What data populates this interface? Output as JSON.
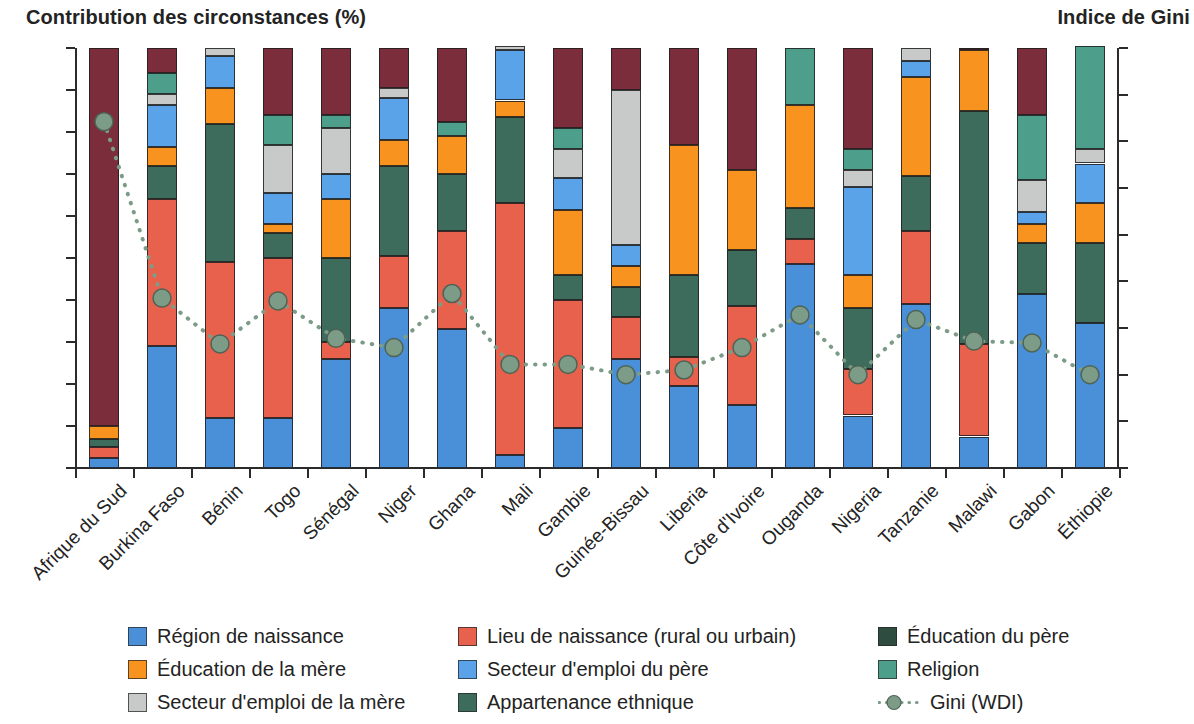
{
  "titles": {
    "left": "Contribution des circonstances (%)",
    "right": "Indice de Gini"
  },
  "axes": {
    "left": {
      "label": "Contribution des circonstances (%)",
      "min": 0,
      "max": 100,
      "step": 10,
      "ticks": [
        "0",
        "10",
        "20",
        "30",
        "40",
        "50",
        "60",
        "70",
        "80",
        "90",
        "100"
      ]
    },
    "right": {
      "label": "Indice de Gini",
      "min": 25,
      "max": 70,
      "step": 5,
      "ticks": [
        "25",
        "30",
        "35",
        "40",
        "45",
        "50",
        "55",
        "60",
        "65",
        "70"
      ]
    }
  },
  "legend": {
    "rows": [
      [
        {
          "key": "region_naissance",
          "label": "Région de naissance",
          "color": "#4A90D9"
        },
        {
          "key": "lieu_naissance",
          "label": "Lieu de naissance (rural ou urbain)",
          "color": "#E8614C"
        },
        {
          "key": "education_pere",
          "label": "Éducation du père",
          "color": "#2E4D40"
        }
      ],
      [
        {
          "key": "education_mere",
          "label": "Éducation de la mère",
          "color": "#F7931E"
        },
        {
          "key": "secteur_pere",
          "label": "Secteur d'emploi du père",
          "color": "#5AA3E8"
        },
        {
          "key": "religion",
          "label": "Religion",
          "color": "#4E9E8C"
        }
      ],
      [
        {
          "key": "secteur_mere",
          "label": "Secteur d'emploi de la mère",
          "color": "#C8C9C9"
        },
        {
          "key": "ethnie",
          "label": "Appartenance ethnique",
          "color": "#3D6B5C"
        },
        {
          "key": "gini",
          "label": "Gini (WDI)",
          "color": "#7C9C87"
        }
      ]
    ]
  },
  "chart_data": {
    "type": "bar",
    "subtype": "stacked-bar-with-line",
    "title": "Contribution des circonstances (%)",
    "xlabel": "",
    "ylabel": "Contribution des circonstances (%)",
    "y2label": "Indice de Gini",
    "ylim": [
      0,
      100
    ],
    "y2lim": [
      25,
      70
    ],
    "grid": false,
    "legend_position": "bottom",
    "categories": [
      "Afrique du Sud",
      "Burkina Faso",
      "Bénin",
      "Togo",
      "Sénégal",
      "Niger",
      "Ghana",
      "Mali",
      "Gambie",
      "Guinée-Bissau",
      "Liberia",
      "Côte d'Ivoire",
      "Ouganda",
      "Nigeria",
      "Tanzanie",
      "Malawi",
      "Gabon",
      "Éthiopie"
    ],
    "stack_order": [
      "region_naissance",
      "lieu_naissance",
      "ethnie",
      "education_mere",
      "education_pere",
      "secteur_pere",
      "secteur_mere",
      "religion",
      "autre"
    ],
    "series": [
      {
        "name": "Région de naissance",
        "key": "region_naissance",
        "color": "#4A90D9",
        "values": [
          2.5,
          29.0,
          12.0,
          12.0,
          26.0,
          38.0,
          33.0,
          3.0,
          9.5,
          26.0,
          19.5,
          15.0,
          48.5,
          12.5,
          39.0,
          7.5,
          41.5,
          34.5
        ]
      },
      {
        "name": "Lieu de naissance (rural ou urbain)",
        "key": "lieu_naissance",
        "color": "#E8614C",
        "values": [
          2.5,
          35.0,
          37.0,
          38.0,
          4.0,
          12.5,
          23.5,
          60.0,
          30.5,
          7.0,
          7.0,
          23.5,
          6.0,
          11.0,
          17.5,
          38.0,
          0.0,
          0.0
        ]
      },
      {
        "name": "Appartenance ethnique",
        "key": "ethnie",
        "color": "#3D6B5C",
        "values": [
          2.0,
          0.0,
          0.0,
          0.0,
          0.0,
          0.0,
          0.0,
          0.0,
          0.0,
          0.0,
          0.0,
          0.0,
          0.0,
          0.0,
          0.0,
          0.0,
          0.0,
          0.0
        ]
      },
      {
        "name": "Éducation de la mère",
        "key": "education_mere",
        "color": "#F7931E",
        "values": [
          3.0,
          0.0,
          0.0,
          0.0,
          0.0,
          0.0,
          0.0,
          0.0,
          0.0,
          0.0,
          0.0,
          0.0,
          0.0,
          0.0,
          0.0,
          0.0,
          0.0,
          0.0
        ]
      },
      {
        "name": "Autre (résiduel)",
        "key": "autre",
        "color": "#7B2D3C",
        "values": [
          90.0,
          0.0,
          0.0,
          0.0,
          0.0,
          0.0,
          0.0,
          0.0,
          0.0,
          0.0,
          0.0,
          0.0,
          0.0,
          0.0,
          0.0,
          0.0,
          0.0,
          0.0
        ]
      }
    ],
    "bars": [
      {
        "country": "Afrique du Sud",
        "segments": [
          {
            "key": "region_naissance",
            "from": 0,
            "to": 2.5
          },
          {
            "key": "lieu_naissance",
            "from": 2.5,
            "to": 5.0
          },
          {
            "key": "ethnie",
            "from": 5.0,
            "to": 7.0
          },
          {
            "key": "education_mere",
            "from": 7.0,
            "to": 10.0
          },
          {
            "key": "autre",
            "from": 10.0,
            "to": 100.0
          }
        ]
      },
      {
        "country": "Burkina Faso",
        "segments": [
          {
            "key": "region_naissance",
            "from": 0,
            "to": 29.0
          },
          {
            "key": "lieu_naissance",
            "from": 29.0,
            "to": 64.0
          },
          {
            "key": "ethnie",
            "from": 64.0,
            "to": 72.0
          },
          {
            "key": "education_mere",
            "from": 72.0,
            "to": 76.5
          },
          {
            "key": "secteur_pere",
            "from": 76.5,
            "to": 86.5
          },
          {
            "key": "secteur_mere",
            "from": 86.5,
            "to": 89.0
          },
          {
            "key": "religion",
            "from": 89.0,
            "to": 94.0
          },
          {
            "key": "autre",
            "from": 94.0,
            "to": 100.0
          }
        ]
      },
      {
        "country": "Bénin",
        "segments": [
          {
            "key": "region_naissance",
            "from": 0,
            "to": 12.0
          },
          {
            "key": "lieu_naissance",
            "from": 12.0,
            "to": 49.0
          },
          {
            "key": "ethnie",
            "from": 49.0,
            "to": 82.0
          },
          {
            "key": "education_mere",
            "from": 82.0,
            "to": 90.5
          },
          {
            "key": "secteur_pere",
            "from": 90.5,
            "to": 98.0
          },
          {
            "key": "secteur_mere",
            "from": 98.0,
            "to": 100.0
          }
        ]
      },
      {
        "country": "Togo",
        "segments": [
          {
            "key": "region_naissance",
            "from": 0,
            "to": 12.0
          },
          {
            "key": "lieu_naissance",
            "from": 12.0,
            "to": 50.0
          },
          {
            "key": "ethnie",
            "from": 50.0,
            "to": 56.0
          },
          {
            "key": "education_mere",
            "from": 56.0,
            "to": 58.0
          },
          {
            "key": "secteur_pere",
            "from": 58.0,
            "to": 65.5
          },
          {
            "key": "secteur_mere",
            "from": 65.5,
            "to": 77.0
          },
          {
            "key": "religion",
            "from": 77.0,
            "to": 84.0
          },
          {
            "key": "autre",
            "from": 84.0,
            "to": 100.0
          }
        ]
      },
      {
        "country": "Sénégal",
        "segments": [
          {
            "key": "region_naissance",
            "from": 0,
            "to": 26.0
          },
          {
            "key": "lieu_naissance",
            "from": 26.0,
            "to": 30.0
          },
          {
            "key": "ethnie",
            "from": 30.0,
            "to": 50.0
          },
          {
            "key": "education_mere",
            "from": 50.0,
            "to": 64.0
          },
          {
            "key": "secteur_pere",
            "from": 64.0,
            "to": 70.0
          },
          {
            "key": "secteur_mere",
            "from": 70.0,
            "to": 81.0
          },
          {
            "key": "religion",
            "from": 81.0,
            "to": 84.0
          },
          {
            "key": "autre",
            "from": 84.0,
            "to": 100.0
          }
        ]
      },
      {
        "country": "Niger",
        "segments": [
          {
            "key": "region_naissance",
            "from": 0,
            "to": 38.0
          },
          {
            "key": "lieu_naissance",
            "from": 38.0,
            "to": 50.5
          },
          {
            "key": "ethnie",
            "from": 50.5,
            "to": 72.0
          },
          {
            "key": "education_mere",
            "from": 72.0,
            "to": 78.0
          },
          {
            "key": "secteur_pere",
            "from": 78.0,
            "to": 88.0
          },
          {
            "key": "secteur_mere",
            "from": 88.0,
            "to": 90.5
          },
          {
            "key": "autre",
            "from": 90.5,
            "to": 100.0
          }
        ]
      },
      {
        "country": "Ghana",
        "segments": [
          {
            "key": "region_naissance",
            "from": 0,
            "to": 33.0
          },
          {
            "key": "lieu_naissance",
            "from": 33.0,
            "to": 56.5
          },
          {
            "key": "ethnie",
            "from": 56.5,
            "to": 70.0
          },
          {
            "key": "education_mere",
            "from": 70.0,
            "to": 79.0
          },
          {
            "key": "religion",
            "from": 79.0,
            "to": 82.5
          },
          {
            "key": "autre",
            "from": 82.5,
            "to": 100.0
          }
        ]
      },
      {
        "country": "Mali",
        "segments": [
          {
            "key": "region_naissance",
            "from": 0,
            "to": 3.0
          },
          {
            "key": "lieu_naissance",
            "from": 3.0,
            "to": 63.0
          },
          {
            "key": "ethnie",
            "from": 63.0,
            "to": 83.5
          },
          {
            "key": "education_mere",
            "from": 83.5,
            "to": 87.5
          },
          {
            "key": "secteur_pere",
            "from": 87.5,
            "to": 99.5
          },
          {
            "key": "secteur_mere",
            "from": 99.5,
            "to": 100.5
          }
        ]
      },
      {
        "country": "Gambie",
        "segments": [
          {
            "key": "region_naissance",
            "from": 0,
            "to": 9.5
          },
          {
            "key": "lieu_naissance",
            "from": 9.5,
            "to": 40.0
          },
          {
            "key": "ethnie",
            "from": 40.0,
            "to": 46.0
          },
          {
            "key": "education_mere",
            "from": 46.0,
            "to": 61.5
          },
          {
            "key": "secteur_pere",
            "from": 61.5,
            "to": 69.0
          },
          {
            "key": "secteur_mere",
            "from": 69.0,
            "to": 76.0
          },
          {
            "key": "religion",
            "from": 76.0,
            "to": 81.0
          },
          {
            "key": "autre",
            "from": 81.0,
            "to": 100.0
          }
        ]
      },
      {
        "country": "Guinée-Bissau",
        "segments": [
          {
            "key": "region_naissance",
            "from": 0,
            "to": 26.0
          },
          {
            "key": "lieu_naissance",
            "from": 26.0,
            "to": 36.0
          },
          {
            "key": "ethnie",
            "from": 36.0,
            "to": 43.0
          },
          {
            "key": "education_mere",
            "from": 43.0,
            "to": 48.0
          },
          {
            "key": "secteur_pere",
            "from": 48.0,
            "to": 53.0
          },
          {
            "key": "secteur_mere",
            "from": 53.0,
            "to": 90.0
          },
          {
            "key": "autre",
            "from": 90.0,
            "to": 100.0
          }
        ]
      },
      {
        "country": "Liberia",
        "segments": [
          {
            "key": "region_naissance",
            "from": 0,
            "to": 19.5
          },
          {
            "key": "lieu_naissance",
            "from": 19.5,
            "to": 26.5
          },
          {
            "key": "ethnie",
            "from": 26.5,
            "to": 46.0
          },
          {
            "key": "education_mere",
            "from": 46.0,
            "to": 77.0
          },
          {
            "key": "autre",
            "from": 77.0,
            "to": 100.0
          }
        ]
      },
      {
        "country": "Côte d'Ivoire",
        "segments": [
          {
            "key": "region_naissance",
            "from": 0,
            "to": 15.0
          },
          {
            "key": "lieu_naissance",
            "from": 15.0,
            "to": 38.5
          },
          {
            "key": "ethnie",
            "from": 38.5,
            "to": 52.0
          },
          {
            "key": "education_mere",
            "from": 52.0,
            "to": 71.0
          },
          {
            "key": "autre",
            "from": 71.0,
            "to": 100.0
          }
        ]
      },
      {
        "country": "Ouganda",
        "segments": [
          {
            "key": "region_naissance",
            "from": 0,
            "to": 48.5
          },
          {
            "key": "lieu_naissance",
            "from": 48.5,
            "to": 54.5
          },
          {
            "key": "ethnie",
            "from": 54.5,
            "to": 62.0
          },
          {
            "key": "education_mere",
            "from": 62.0,
            "to": 86.5
          },
          {
            "key": "religion",
            "from": 86.5,
            "to": 100.0
          }
        ]
      },
      {
        "country": "Nigeria",
        "segments": [
          {
            "key": "region_naissance",
            "from": 0,
            "to": 12.5
          },
          {
            "key": "lieu_naissance",
            "from": 12.5,
            "to": 23.5
          },
          {
            "key": "ethnie",
            "from": 23.5,
            "to": 38.0
          },
          {
            "key": "education_mere",
            "from": 38.0,
            "to": 46.0
          },
          {
            "key": "secteur_pere",
            "from": 46.0,
            "to": 67.0
          },
          {
            "key": "secteur_mere",
            "from": 67.0,
            "to": 71.0
          },
          {
            "key": "religion",
            "from": 71.0,
            "to": 76.0
          },
          {
            "key": "autre",
            "from": 76.0,
            "to": 100.0
          }
        ]
      },
      {
        "country": "Tanzanie",
        "segments": [
          {
            "key": "region_naissance",
            "from": 0,
            "to": 39.0
          },
          {
            "key": "lieu_naissance",
            "from": 39.0,
            "to": 56.5
          },
          {
            "key": "ethnie",
            "from": 56.5,
            "to": 69.5
          },
          {
            "key": "education_mere",
            "from": 69.5,
            "to": 93.0
          },
          {
            "key": "secteur_pere",
            "from": 93.0,
            "to": 97.0
          },
          {
            "key": "secteur_mere",
            "from": 97.0,
            "to": 100.0
          }
        ]
      },
      {
        "country": "Malawi",
        "segments": [
          {
            "key": "region_naissance",
            "from": 0,
            "to": 7.5
          },
          {
            "key": "lieu_naissance",
            "from": 7.5,
            "to": 29.5
          },
          {
            "key": "ethnie",
            "from": 29.5,
            "to": 85.0
          },
          {
            "key": "education_mere",
            "from": 85.0,
            "to": 99.5
          },
          {
            "key": "autre",
            "from": 99.5,
            "to": 100.0
          }
        ]
      },
      {
        "country": "Gabon",
        "segments": [
          {
            "key": "region_naissance",
            "from": 0,
            "to": 41.5
          },
          {
            "key": "ethnie",
            "from": 41.5,
            "to": 53.5
          },
          {
            "key": "education_mere",
            "from": 53.5,
            "to": 58.0
          },
          {
            "key": "secteur_pere",
            "from": 58.0,
            "to": 61.0
          },
          {
            "key": "secteur_mere",
            "from": 61.0,
            "to": 68.5
          },
          {
            "key": "religion",
            "from": 68.5,
            "to": 84.0
          },
          {
            "key": "autre",
            "from": 84.0,
            "to": 100.0
          }
        ]
      },
      {
        "country": "Éthiopie",
        "segments": [
          {
            "key": "region_naissance",
            "from": 0,
            "to": 34.5
          },
          {
            "key": "ethnie",
            "from": 34.5,
            "to": 53.5
          },
          {
            "key": "education_mere",
            "from": 53.5,
            "to": 63.0
          },
          {
            "key": "secteur_pere",
            "from": 63.0,
            "to": 72.5
          },
          {
            "key": "secteur_mere",
            "from": 72.5,
            "to": 76.0
          },
          {
            "key": "religion",
            "from": 76.0,
            "to": 100.5
          }
        ]
      }
    ],
    "gini_line": {
      "name": "Gini (WDI)",
      "color": "#7C9C87",
      "style": "dotted",
      "marker": "circle",
      "axis": "right",
      "values": [
        62.1,
        43.2,
        38.3,
        42.9,
        38.9,
        37.9,
        43.7,
        36.1,
        36.1,
        35.0,
        35.5,
        37.9,
        41.4,
        35.0,
        40.9,
        38.6,
        38.4,
        35.0
      ]
    }
  }
}
